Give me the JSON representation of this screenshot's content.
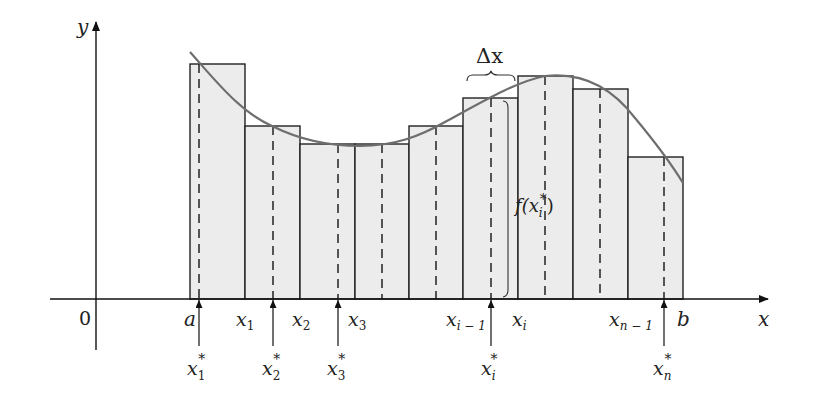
{
  "diagram": {
    "colors": {
      "rect_fill": "#ececec",
      "rect_stroke": "#222222",
      "curve": "#6e6e6e",
      "axis": "#111111",
      "text": "#222222"
    },
    "axes": {
      "x_label": "x",
      "y_label": "y",
      "origin_label": "0"
    },
    "delta_label": "Δx",
    "height_label": "f(x",
    "height_label_sub": "i",
    "height_label_sup": "*",
    "height_label_close": ")",
    "partition_labels": [
      {
        "main": "a",
        "sub": ""
      },
      {
        "main": "x",
        "sub": "1"
      },
      {
        "main": "x",
        "sub": "2"
      },
      {
        "main": "x",
        "sub": "3"
      },
      {
        "main": "x",
        "sub": "i − 1"
      },
      {
        "main": "x",
        "sub": "i"
      },
      {
        "main": "x",
        "sub": "n − 1"
      },
      {
        "main": "b",
        "sub": ""
      }
    ],
    "sample_labels": [
      {
        "main": "x",
        "sub": "1",
        "sup": "*"
      },
      {
        "main": "x",
        "sub": "2",
        "sup": "*"
      },
      {
        "main": "x",
        "sub": "3",
        "sup": "*"
      },
      {
        "main": "x",
        "sub": "i",
        "sup": "*"
      },
      {
        "main": "x",
        "sub": "n",
        "sup": "*"
      }
    ],
    "rectangles": [
      {
        "x0": 190,
        "x1": 245,
        "top": 64,
        "sample": 199
      },
      {
        "x0": 245,
        "x1": 300,
        "top": 126,
        "sample": 273
      },
      {
        "x0": 300,
        "x1": 355,
        "top": 144,
        "sample": 338
      },
      {
        "x0": 355,
        "x1": 409,
        "top": 144,
        "sample": 382
      },
      {
        "x0": 409,
        "x1": 463,
        "top": 126,
        "sample": 436
      },
      {
        "x0": 463,
        "x1": 518,
        "top": 98,
        "sample": 491
      },
      {
        "x0": 518,
        "x1": 573,
        "top": 76,
        "sample": 545
      },
      {
        "x0": 573,
        "x1": 628,
        "top": 89,
        "sample": 600
      },
      {
        "x0": 628,
        "x1": 683,
        "top": 157,
        "sample": 664
      }
    ]
  }
}
